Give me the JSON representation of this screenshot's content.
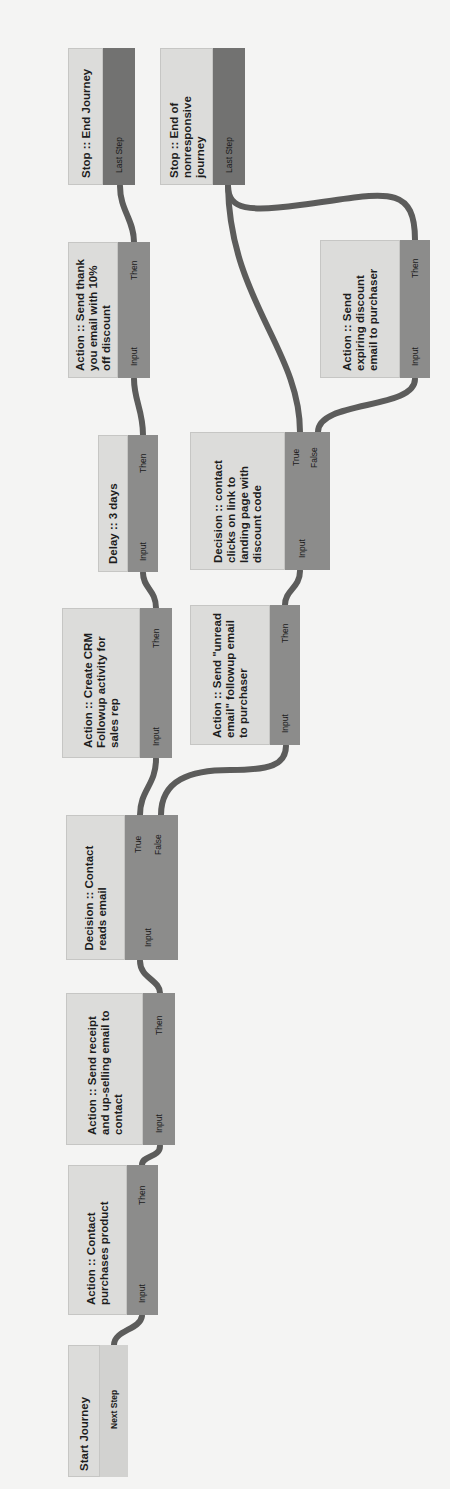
{
  "diagram": {
    "orientation": "rotated-90-ccw",
    "colors": {
      "background": "#f4f4f3",
      "node_label_fill": "#dcdcda",
      "node_port_fill": "#8c8c8b",
      "stop_port_fill": "#727271",
      "connector": "#5c5c5b",
      "text": "#1d1d1d"
    },
    "nodes": [
      {
        "id": "start",
        "label": "Start Journey",
        "ports": {
          "out": [
            "Next Step"
          ]
        }
      },
      {
        "id": "purchase",
        "label": "Action :: Contact purchases product",
        "ports": {
          "in": "Input",
          "out": [
            "Then"
          ]
        }
      },
      {
        "id": "receipt",
        "label": "Action :: Send receipt and up-selling email to contact",
        "ports": {
          "in": "Input",
          "out": [
            "Then"
          ]
        }
      },
      {
        "id": "reads",
        "label": "Decision :: Contact reads email",
        "ports": {
          "in": "Input",
          "out": [
            "True",
            "False"
          ]
        }
      },
      {
        "id": "crm",
        "label": "Action :: Create CRM Followup activity for sales rep",
        "ports": {
          "in": "Input",
          "out": [
            "Then"
          ]
        }
      },
      {
        "id": "delay",
        "label": "Delay :: 3 days",
        "ports": {
          "in": "Input",
          "out": [
            "Then"
          ]
        }
      },
      {
        "id": "thanks",
        "label": "Action :: Send thank you email with 10% off discount",
        "ports": {
          "in": "Input",
          "out": [
            "Then"
          ]
        }
      },
      {
        "id": "stop1",
        "label": "Stop :: End Journey",
        "ports": {
          "in": "Last Step"
        }
      },
      {
        "id": "unread",
        "label": "Action :: Send \"unread email\" followup email to purchaser",
        "ports": {
          "in": "Input",
          "out": [
            "Then"
          ]
        }
      },
      {
        "id": "clicks",
        "label": "Decision :: contact clicks on link to landing page with discount code",
        "ports": {
          "in": "Input",
          "out": [
            "True",
            "False"
          ]
        }
      },
      {
        "id": "expiring",
        "label": "Action :: Send expiring discount email to purchaser",
        "ports": {
          "in": "Input",
          "out": [
            "Then"
          ]
        }
      },
      {
        "id": "stop2",
        "label": "Stop :: End of nonresponsive journey",
        "ports": {
          "in": "Last Step"
        }
      }
    ],
    "edges": [
      {
        "from": "start",
        "port": "Next Step",
        "to": "purchase"
      },
      {
        "from": "purchase",
        "port": "Then",
        "to": "receipt"
      },
      {
        "from": "receipt",
        "port": "Then",
        "to": "reads"
      },
      {
        "from": "reads",
        "port": "True",
        "to": "crm"
      },
      {
        "from": "reads",
        "port": "False",
        "to": "unread"
      },
      {
        "from": "crm",
        "port": "Then",
        "to": "delay"
      },
      {
        "from": "delay",
        "port": "Then",
        "to": "thanks"
      },
      {
        "from": "thanks",
        "port": "Then",
        "to": "stop1"
      },
      {
        "from": "unread",
        "port": "Then",
        "to": "clicks"
      },
      {
        "from": "clicks",
        "port": "True",
        "to": "stop2"
      },
      {
        "from": "clicks",
        "port": "False",
        "to": "expiring"
      },
      {
        "from": "expiring",
        "port": "Then",
        "to": "stop2"
      }
    ]
  }
}
